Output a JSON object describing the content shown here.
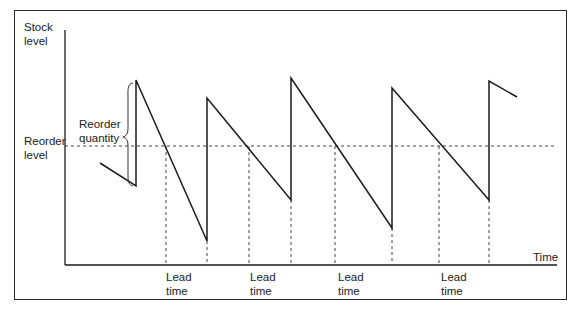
{
  "diagram": {
    "y_axis_label": [
      "Stock",
      "level"
    ],
    "x_axis_label": "Time",
    "reorder_level_label": [
      "Reorder",
      "level"
    ],
    "reorder_quantity_label": [
      "Reorder",
      "quantity"
    ],
    "lead_time_labels": [
      [
        "Lead",
        "time"
      ],
      [
        "Lead",
        "time"
      ],
      [
        "Lead",
        "time"
      ],
      [
        "Lead",
        "time"
      ]
    ],
    "colors": {
      "line": "#1a1a1a",
      "dashed": "#444444",
      "background": "#ffffff"
    },
    "stock_polyline": [
      [
        100,
        163
      ],
      [
        136,
        186
      ],
      [
        136,
        80
      ],
      [
        207,
        241
      ],
      [
        207,
        98
      ],
      [
        291,
        200
      ],
      [
        291,
        78
      ],
      [
        392,
        228
      ],
      [
        392,
        88
      ],
      [
        489,
        200
      ],
      [
        489,
        81
      ],
      [
        517,
        97
      ]
    ],
    "reorder_level_y": 146,
    "lead_time_intervals": [
      [
        166,
        207
      ],
      [
        249,
        291
      ],
      [
        335,
        392
      ],
      [
        439,
        489
      ]
    ]
  }
}
